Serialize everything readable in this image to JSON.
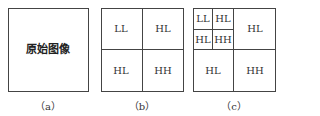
{
  "panels": [
    {
      "id": "a",
      "caption": "（a）",
      "cells": [
        {
          "label": "原始图像"
        }
      ]
    },
    {
      "id": "b",
      "caption": "（b）",
      "cells": [
        {
          "position": "top-left",
          "label": "LL"
        },
        {
          "position": "top-right",
          "label": "HL"
        },
        {
          "position": "bottom-left",
          "label": "HL"
        },
        {
          "position": "bottom-right",
          "label": "HH"
        }
      ]
    },
    {
      "id": "c",
      "caption": "（c）",
      "cells": [
        {
          "position": "top-left-top-left",
          "label": "LL"
        },
        {
          "position": "top-left-top-right",
          "label": "HL"
        },
        {
          "position": "top-left-bottom-left",
          "label": "HL"
        },
        {
          "position": "top-left-bottom-right",
          "label": "HH"
        },
        {
          "position": "top-right",
          "label": "HL"
        },
        {
          "position": "bottom-left",
          "label": "HL"
        },
        {
          "position": "bottom-right",
          "label": "HH"
        }
      ]
    }
  ]
}
